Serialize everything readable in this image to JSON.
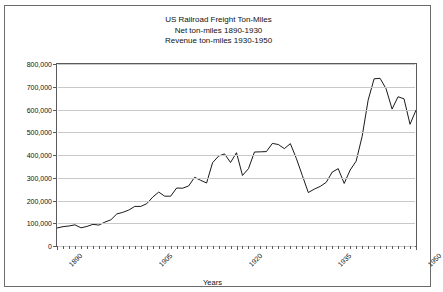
{
  "chart_data": {
    "type": "line",
    "title": "US Railroad Freight Ton-Miles",
    "subtitle_1": "Net ton-miles 1890-1930",
    "subtitle_2": "Revenue ton-miles 1930-1950",
    "xlabel": "Years",
    "ylabel": "Ton-Miles (Millions)",
    "xlim": [
      1890,
      1950
    ],
    "ylim": [
      0,
      800000
    ],
    "ytick_step": 100000,
    "grid": "horizontal",
    "legend": "none",
    "line_color": "#000000",
    "y_ticks": [
      "0",
      "100,000",
      "200,000",
      "300,000",
      "400,000",
      "500,000",
      "600,000",
      "700,000",
      "800,000"
    ],
    "x_ticks": [
      "1890",
      "1905",
      "1920",
      "1935",
      "1950"
    ],
    "x_tick_years": [
      1890,
      1905,
      1920,
      1935,
      1950
    ],
    "series": [
      {
        "name": "Ton-Miles",
        "x": [
          1890,
          1891,
          1892,
          1893,
          1894,
          1895,
          1896,
          1897,
          1898,
          1899,
          1900,
          1901,
          1902,
          1903,
          1904,
          1905,
          1906,
          1907,
          1908,
          1909,
          1910,
          1911,
          1912,
          1913,
          1914,
          1915,
          1916,
          1917,
          1918,
          1919,
          1920,
          1921,
          1922,
          1923,
          1924,
          1925,
          1926,
          1927,
          1928,
          1929,
          1930,
          1931,
          1932,
          1933,
          1934,
          1935,
          1936,
          1937,
          1938,
          1939,
          1940,
          1941,
          1942,
          1943,
          1944,
          1945,
          1946,
          1947,
          1948,
          1949,
          1950
        ],
        "values": [
          79000,
          85000,
          88000,
          93000,
          80000,
          86000,
          95000,
          92000,
          105000,
          115000,
          141000,
          148000,
          158000,
          174000,
          174000,
          186000,
          215000,
          237000,
          219000,
          219000,
          255000,
          254000,
          264000,
          302000,
          289000,
          277000,
          366000,
          395000,
          405000,
          367000,
          410000,
          310000,
          340000,
          413000,
          414000,
          415000,
          451000,
          446000,
          428000,
          450000,
          385000,
          310000,
          235000,
          250000,
          262000,
          280000,
          325000,
          340000,
          275000,
          334000,
          373000,
          482000,
          641000,
          735000,
          737000,
          691000,
          602000,
          656000,
          647000,
          535000,
          597000
        ]
      }
    ]
  }
}
